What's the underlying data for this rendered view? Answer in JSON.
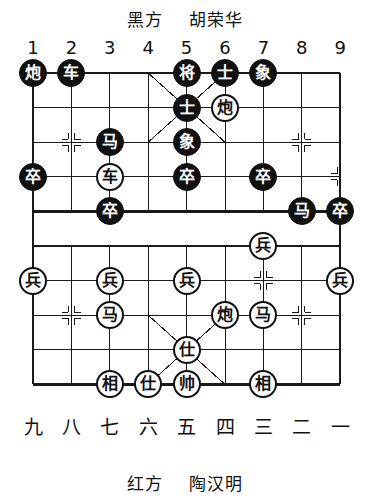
{
  "header": {
    "black_side_label": "黑方",
    "black_player": "胡荣华",
    "black_caption": "黑方    胡荣华"
  },
  "footer": {
    "red_side_label": "红方",
    "red_player": "陶汉明",
    "red_caption": "红方    陶汉明"
  },
  "axis": {
    "top_labels": [
      "1",
      "2",
      "3",
      "4",
      "5",
      "6",
      "7",
      "8",
      "9"
    ],
    "bottom_labels": [
      "九",
      "八",
      "七",
      "六",
      "五",
      "四",
      "三",
      "二",
      "一"
    ]
  },
  "board": {
    "columns": 9,
    "rows": 10,
    "line_color": "#1a1a1a",
    "background_color": "#ffffff",
    "black_piece_fill": "#111111",
    "black_piece_text": "#ffffff",
    "red_piece_fill": "#ffffff",
    "red_piece_text": "#111111"
  },
  "pieces": [
    {
      "name": "black-cannon-c1r0",
      "label": "炮",
      "side": "black",
      "col": 1,
      "row": 0
    },
    {
      "name": "black-chariot-c2r0",
      "label": "车",
      "side": "black",
      "col": 2,
      "row": 0
    },
    {
      "name": "black-general-c5r0",
      "label": "将",
      "side": "black",
      "col": 5,
      "row": 0
    },
    {
      "name": "black-advisor-c6r0",
      "label": "士",
      "side": "black",
      "col": 6,
      "row": 0
    },
    {
      "name": "black-elephant-c7r0",
      "label": "象",
      "side": "black",
      "col": 7,
      "row": 0
    },
    {
      "name": "black-advisor-c5r1",
      "label": "士",
      "side": "black",
      "col": 5,
      "row": 1
    },
    {
      "name": "red-cannon-c6r1",
      "label": "炮",
      "side": "red",
      "col": 6,
      "row": 1
    },
    {
      "name": "black-horse-c3r2",
      "label": "马",
      "side": "black",
      "col": 3,
      "row": 2
    },
    {
      "name": "black-elephant-c5r2",
      "label": "象",
      "side": "black",
      "col": 5,
      "row": 2
    },
    {
      "name": "black-pawn-c1r3",
      "label": "卒",
      "side": "black",
      "col": 1,
      "row": 3
    },
    {
      "name": "red-chariot-c3r3",
      "label": "车",
      "side": "red",
      "col": 3,
      "row": 3
    },
    {
      "name": "black-pawn-c5r3",
      "label": "卒",
      "side": "black",
      "col": 5,
      "row": 3
    },
    {
      "name": "black-pawn-c7r3",
      "label": "卒",
      "side": "black",
      "col": 7,
      "row": 3
    },
    {
      "name": "black-pawn-c3r4",
      "label": "卒",
      "side": "black",
      "col": 3,
      "row": 4
    },
    {
      "name": "black-horse-c8r4",
      "label": "马",
      "side": "black",
      "col": 8,
      "row": 4
    },
    {
      "name": "black-pawn-c9r4",
      "label": "卒",
      "side": "black",
      "col": 9,
      "row": 4
    },
    {
      "name": "red-soldier-c7r5",
      "label": "兵",
      "side": "red",
      "col": 7,
      "row": 5
    },
    {
      "name": "red-soldier-c1r6",
      "label": "兵",
      "side": "red",
      "col": 1,
      "row": 6
    },
    {
      "name": "red-soldier-c3r6",
      "label": "兵",
      "side": "red",
      "col": 3,
      "row": 6
    },
    {
      "name": "red-soldier-c5r6",
      "label": "兵",
      "side": "red",
      "col": 5,
      "row": 6
    },
    {
      "name": "red-soldier-c9r6",
      "label": "兵",
      "side": "red",
      "col": 9,
      "row": 6
    },
    {
      "name": "red-horse-c3r7",
      "label": "马",
      "side": "red",
      "col": 3,
      "row": 7
    },
    {
      "name": "red-cannon-c6r7",
      "label": "炮",
      "side": "red",
      "col": 6,
      "row": 7
    },
    {
      "name": "red-horse-c7r7",
      "label": "马",
      "side": "red",
      "col": 7,
      "row": 7
    },
    {
      "name": "red-advisor-c5r8",
      "label": "仕",
      "side": "red",
      "col": 5,
      "row": 8
    },
    {
      "name": "red-minister-c3r9",
      "label": "相",
      "side": "red",
      "col": 3,
      "row": 9
    },
    {
      "name": "red-advisor-c4r9",
      "label": "仕",
      "side": "red",
      "col": 4,
      "row": 9
    },
    {
      "name": "red-marshal-c5r9",
      "label": "帅",
      "side": "red",
      "col": 5,
      "row": 9
    },
    {
      "name": "red-minister-c7r9",
      "label": "相",
      "side": "red",
      "col": 7,
      "row": 9
    }
  ],
  "geometry": {
    "origin_x": 33,
    "origin_y": 73,
    "cell_w": 38.4,
    "cell_h": 34.6
  }
}
